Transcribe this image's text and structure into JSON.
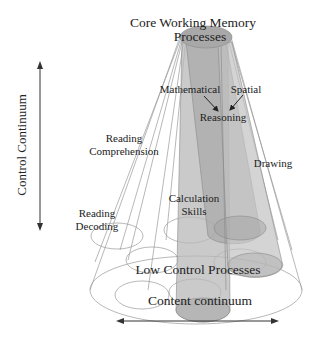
{
  "title": {
    "line1": "Core Working Memory",
    "line2": "Processes"
  },
  "labels": {
    "mathematical": "Mathematical",
    "spatial": "Spatial",
    "reasoning": "Reasoning",
    "reading_comprehension_1": "Reading",
    "reading_comprehension_2": "Comprehension",
    "drawing": "Drawing",
    "calculation_1": "Calculation",
    "calculation_2": "Skills",
    "reading_decoding_1": "Reading",
    "reading_decoding_2": "Decoding",
    "low_control": "Low Control Processes"
  },
  "axes": {
    "vertical": "Control Continuum",
    "horizontal": "Content continuum"
  },
  "colors": {
    "cylinder_fill": "#b4b4b4",
    "cylinder_dark": "#9c9c9c",
    "outline": "#9a9a9a",
    "text": "#222222"
  }
}
